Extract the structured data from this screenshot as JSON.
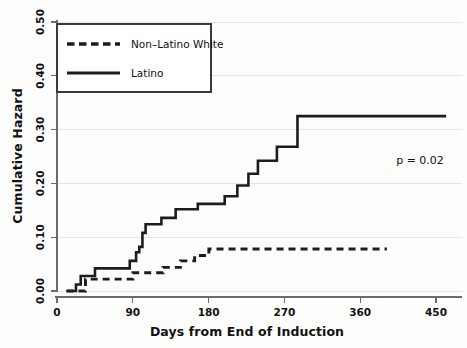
{
  "chart_data": {
    "type": "line",
    "subtype": "step-cumulative-hazard",
    "title": "",
    "xlabel": "Days from End of Induction",
    "ylabel": "Cumulative Hazard",
    "xlim": [
      -12,
      500
    ],
    "ylim": [
      0.0,
      0.5
    ],
    "xticks": [
      0,
      90,
      180,
      270,
      360,
      450
    ],
    "xtick_labels": [
      "0",
      "90",
      "180",
      "270",
      "360",
      "450"
    ],
    "yticks": [
      0.0,
      0.1,
      0.2,
      0.3,
      0.4,
      0.5
    ],
    "ytick_labels": [
      "0.00",
      "0.10",
      "0.20",
      "0.30",
      "0.40",
      "0.50"
    ],
    "grid": true,
    "grid_axis": "y",
    "legend_position": "top-left",
    "annotations": [
      {
        "name": "p-value",
        "text": "p = 0.02",
        "x": 420,
        "y": 0.225
      }
    ],
    "series": [
      {
        "name": "Non-Latino White",
        "label": "Non–Latino White",
        "style": "dashed",
        "color": "#1c1c1c",
        "points": [
          [
            0,
            0.0
          ],
          [
            22,
            0.0
          ],
          [
            24,
            0.022
          ],
          [
            80,
            0.022
          ],
          [
            84,
            0.034
          ],
          [
            118,
            0.034
          ],
          [
            122,
            0.044
          ],
          [
            140,
            0.044
          ],
          [
            144,
            0.056
          ],
          [
            158,
            0.056
          ],
          [
            162,
            0.066
          ],
          [
            176,
            0.066
          ],
          [
            180,
            0.078
          ],
          [
            405,
            0.078
          ]
        ]
      },
      {
        "name": "Latino",
        "label": "Latino",
        "style": "solid",
        "color": "#1c1c1c",
        "points": [
          [
            0,
            0.0
          ],
          [
            10,
            0.0
          ],
          [
            12,
            0.012
          ],
          [
            16,
            0.012
          ],
          [
            18,
            0.028
          ],
          [
            32,
            0.028
          ],
          [
            36,
            0.042
          ],
          [
            76,
            0.042
          ],
          [
            80,
            0.056
          ],
          [
            86,
            0.056
          ],
          [
            88,
            0.072
          ],
          [
            92,
            0.082
          ],
          [
            96,
            0.108
          ],
          [
            100,
            0.124
          ],
          [
            116,
            0.124
          ],
          [
            120,
            0.136
          ],
          [
            134,
            0.136
          ],
          [
            138,
            0.152
          ],
          [
            162,
            0.152
          ],
          [
            166,
            0.162
          ],
          [
            196,
            0.162
          ],
          [
            200,
            0.176
          ],
          [
            212,
            0.176
          ],
          [
            216,
            0.196
          ],
          [
            226,
            0.196
          ],
          [
            230,
            0.218
          ],
          [
            238,
            0.218
          ],
          [
            242,
            0.242
          ],
          [
            262,
            0.242
          ],
          [
            266,
            0.268
          ],
          [
            288,
            0.268
          ],
          [
            292,
            0.325
          ],
          [
            480,
            0.325
          ]
        ]
      }
    ]
  },
  "legend": {
    "items": [
      {
        "label": "Non–Latino White",
        "style": "dashed"
      },
      {
        "label": "Latino",
        "style": "solid"
      }
    ]
  },
  "axes": {
    "x_title": "Days from End of Induction",
    "y_title": "Cumulative Hazard",
    "x_ticks": [
      "0",
      "90",
      "180",
      "270",
      "360",
      "450"
    ],
    "y_ticks": [
      "0.00",
      "0.10",
      "0.20",
      "0.30",
      "0.40",
      "0.50"
    ]
  },
  "annotation": {
    "pvalue": "p = 0.02"
  }
}
